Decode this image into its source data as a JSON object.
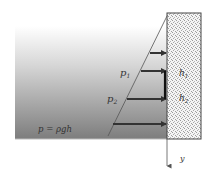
{
  "labels": {
    "p1": "p",
    "p1_sub": "1",
    "p2": "p",
    "p2_sub": "2",
    "h1": "h",
    "h1_sub": "1",
    "h2": "h",
    "h2_sub": "2",
    "formula": "p = ρgh",
    "axis": "y"
  },
  "colors": {
    "fluid_top": "#ffffff",
    "fluid_bottom": "#7a7a7a",
    "wall_fill": "#f2f2f2",
    "wall_border": "#444444",
    "arrow": "#333333",
    "line": "#555555"
  }
}
